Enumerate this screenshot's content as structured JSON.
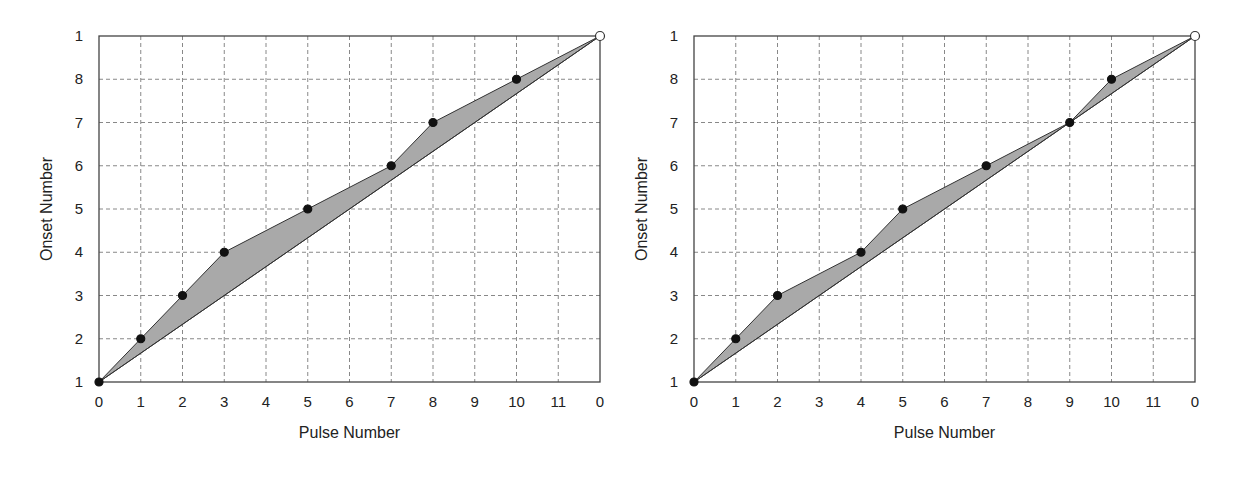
{
  "chart_data": [
    {
      "type": "line",
      "title": "",
      "xlabel": "Pulse Number",
      "ylabel": "Onset Number",
      "x_tick_labels": [
        "0",
        "1",
        "2",
        "3",
        "4",
        "5",
        "6",
        "7",
        "8",
        "9",
        "10",
        "11",
        "0"
      ],
      "y_tick_labels": [
        "1",
        "2",
        "3",
        "4",
        "5",
        "6",
        "7",
        "8",
        "1"
      ],
      "xlim": [
        0,
        12
      ],
      "ylim": [
        1,
        9
      ],
      "grid": true,
      "series": [
        {
          "name": "onsets",
          "x": [
            0,
            1,
            2,
            3,
            5,
            7,
            8,
            10,
            12
          ],
          "y": [
            1,
            2,
            3,
            4,
            5,
            6,
            7,
            8,
            9
          ],
          "marker": "filled-dot",
          "last_marker": "open-circle"
        },
        {
          "name": "isochronous-reference",
          "x": [
            0,
            12
          ],
          "y": [
            1,
            9
          ]
        }
      ],
      "fill": {
        "between": [
          "onsets",
          "isochronous-reference"
        ],
        "color": "#a9a9a9"
      }
    },
    {
      "type": "line",
      "title": "",
      "xlabel": "Pulse Number",
      "ylabel": "Onset Number",
      "x_tick_labels": [
        "0",
        "1",
        "2",
        "3",
        "4",
        "5",
        "6",
        "7",
        "8",
        "9",
        "10",
        "11",
        "0"
      ],
      "y_tick_labels": [
        "1",
        "2",
        "3",
        "4",
        "5",
        "6",
        "7",
        "8",
        "1"
      ],
      "xlim": [
        0,
        12
      ],
      "ylim": [
        1,
        9
      ],
      "grid": true,
      "series": [
        {
          "name": "onsets",
          "x": [
            0,
            1,
            2,
            4,
            5,
            7,
            9,
            10,
            12
          ],
          "y": [
            1,
            2,
            3,
            4,
            5,
            6,
            7,
            8,
            9
          ],
          "marker": "filled-dot",
          "last_marker": "open-circle"
        },
        {
          "name": "isochronous-reference",
          "x": [
            0,
            12
          ],
          "y": [
            1,
            9
          ]
        }
      ],
      "fill": {
        "between": [
          "onsets",
          "isochronous-reference"
        ],
        "color": "#a9a9a9"
      }
    }
  ],
  "style": {
    "fill_color": "#a9a9a9",
    "line_color": "#333333",
    "grid_color": "#888888",
    "axis_color": "#444444"
  }
}
